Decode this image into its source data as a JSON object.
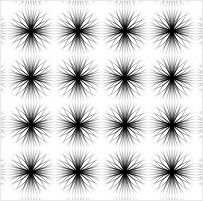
{
  "figure": {
    "title": "Radial Starburst Moire Grid",
    "type": "optical-illusion-pattern",
    "width": 203,
    "height": 201
  },
  "canvas": {
    "background_color": "#ffffff",
    "border_color": "#e8e8e8",
    "border_width": 1
  },
  "pattern": {
    "name": "radial-burst-lattice",
    "line_color": "#000000",
    "grid_pitch_x": 47,
    "grid_pitch_y": 47,
    "node_origin_x": 31,
    "node_origin_y": 31,
    "node_columns": 4,
    "node_rows": 4,
    "node_centers_x": [
      31,
      78,
      125,
      172
    ],
    "node_centers_y": [
      31,
      78,
      125,
      172
    ],
    "extra_margin_nodes": 1,
    "rays_per_node": 48,
    "ray_angle_step_deg": 7.5,
    "ray_reach": 23.5,
    "ray_max_width": 1.55,
    "ray_min_width": 0.3,
    "ray_max_opacity": 1,
    "ray_min_opacity": 0.06,
    "ray_segments": 16,
    "core_radius": 2.6,
    "axis_emphasis": 1.45,
    "bow_amount": 3.4
  },
  "legend": {
    "node_label": "burst-node",
    "ray_label": "ray",
    "lens_label": "lens-moire-cell"
  }
}
